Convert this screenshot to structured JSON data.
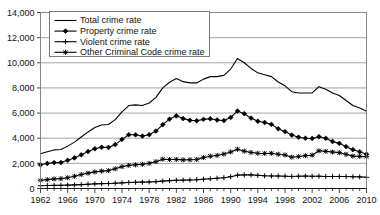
{
  "chart_data": {
    "type": "line",
    "title": "",
    "subtitle": "",
    "xlabel": "",
    "ylabel": "",
    "xlim": [
      1962,
      2010
    ],
    "ylim": [
      0,
      14000
    ],
    "grid": true,
    "legend_position": "top-left",
    "y_ticks": [
      "0",
      "2,000",
      "4,000",
      "6,000",
      "8,000",
      "10,000",
      "12,000",
      "14,000"
    ],
    "y_tick_values": [
      0,
      2000,
      4000,
      6000,
      8000,
      10000,
      12000,
      14000
    ],
    "x_ticks": [
      "1962",
      "1966",
      "1970",
      "1974",
      "1978",
      "1982",
      "1986",
      "1990",
      "1994",
      "1998",
      "2002",
      "2006",
      "2010"
    ],
    "x_tick_values": [
      1962,
      1966,
      1970,
      1974,
      1978,
      1982,
      1986,
      1990,
      1994,
      1998,
      2002,
      2006,
      2010
    ],
    "x": [
      1962,
      1963,
      1964,
      1965,
      1966,
      1967,
      1968,
      1969,
      1970,
      1971,
      1972,
      1973,
      1974,
      1975,
      1976,
      1977,
      1978,
      1979,
      1980,
      1981,
      1982,
      1983,
      1984,
      1985,
      1986,
      1987,
      1988,
      1989,
      1990,
      1991,
      1992,
      1993,
      1994,
      1995,
      1996,
      1997,
      1998,
      1999,
      2000,
      2001,
      2002,
      2003,
      2004,
      2005,
      2006,
      2007,
      2008,
      2009,
      2010
    ],
    "series": [
      {
        "name": "Total crime rate",
        "marker": "none",
        "values": [
          2771,
          2930,
          3070,
          3100,
          3370,
          3690,
          4100,
          4500,
          4850,
          5050,
          5090,
          5480,
          6100,
          6600,
          6650,
          6600,
          6800,
          7250,
          8000,
          8450,
          8750,
          8500,
          8400,
          8400,
          8700,
          8900,
          8900,
          9000,
          9500,
          10342,
          10000,
          9550,
          9200,
          9050,
          8900,
          8470,
          8170,
          7700,
          7600,
          7600,
          7600,
          8100,
          7900,
          7600,
          7400,
          7000,
          6600,
          6400,
          6150
        ]
      },
      {
        "name": "Property crime rate",
        "marker": "diamond",
        "values": [
          1891,
          1990,
          2060,
          2060,
          2240,
          2430,
          2680,
          2940,
          3160,
          3280,
          3270,
          3490,
          3910,
          4280,
          4270,
          4170,
          4280,
          4570,
          5080,
          5520,
          5780,
          5560,
          5430,
          5390,
          5500,
          5550,
          5450,
          5400,
          5650,
          6160,
          5950,
          5600,
          5350,
          5250,
          5100,
          4750,
          4520,
          4250,
          4080,
          4000,
          3980,
          4120,
          3990,
          3740,
          3590,
          3330,
          3090,
          2920,
          2730
        ]
      },
      {
        "name": "Violent crime rate",
        "marker": "plus",
        "values": [
          221,
          235,
          248,
          255,
          270,
          290,
          310,
          340,
          370,
          385,
          395,
          420,
          450,
          480,
          495,
          505,
          520,
          545,
          590,
          625,
          655,
          665,
          680,
          700,
          740,
          780,
          820,
          860,
          940,
          1060,
          1080,
          1080,
          1050,
          1010,
          1000,
          995,
          980,
          960,
          980,
          990,
          970,
          980,
          955,
          960,
          960,
          950,
          935,
          925,
          890
        ]
      },
      {
        "name": "Other Criminal Code crime rate",
        "marker": "star",
        "values": [
          659,
          705,
          762,
          785,
          860,
          970,
          1110,
          1220,
          1320,
          1385,
          1425,
          1570,
          1740,
          1840,
          1885,
          1925,
          2000,
          2135,
          2330,
          2305,
          2315,
          2275,
          2290,
          2310,
          2460,
          2570,
          2630,
          2740,
          2910,
          3122,
          2970,
          2870,
          2800,
          2790,
          2800,
          2725,
          2670,
          2490,
          2540,
          2610,
          2650,
          3000,
          2955,
          2900,
          2850,
          2720,
          2575,
          2555,
          2530
        ]
      }
    ]
  },
  "legend": {
    "items": [
      {
        "label": "Total crime rate",
        "marker": "none"
      },
      {
        "label": "Property crime rate",
        "marker": "diamond"
      },
      {
        "label": "Violent crime rate",
        "marker": "plus"
      },
      {
        "label": "Other Criminal Code crime rate",
        "marker": "star"
      }
    ]
  }
}
